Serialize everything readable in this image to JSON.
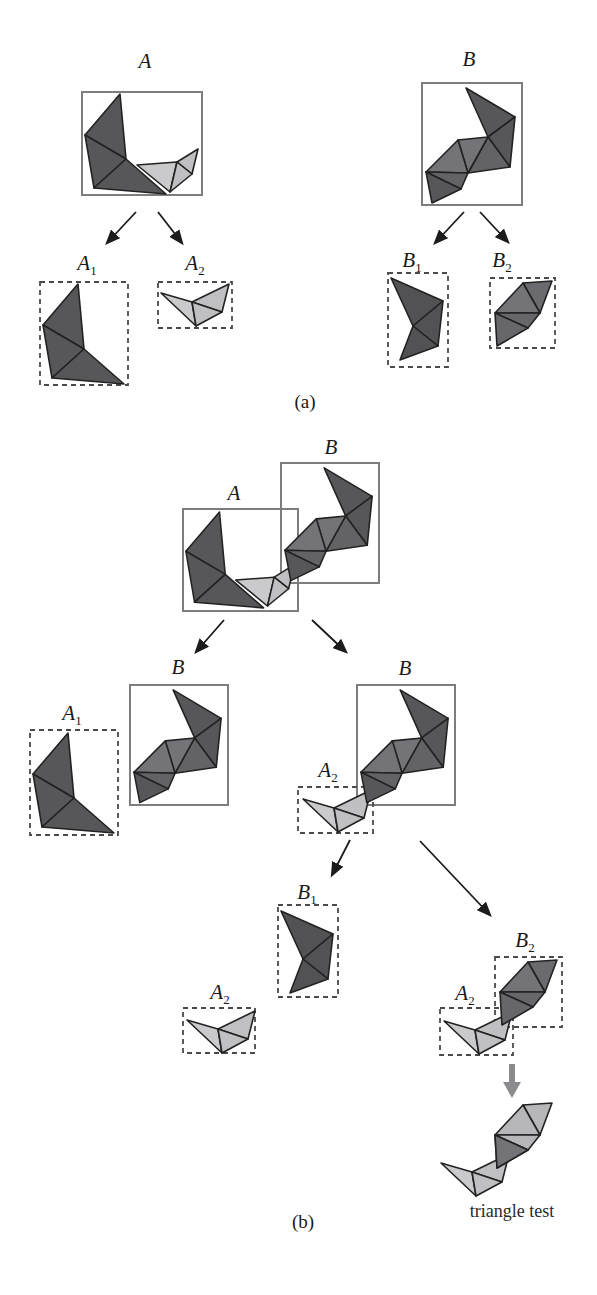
{
  "labels": {
    "A": "A",
    "B": "B",
    "sub1": "1",
    "sub2": "2",
    "panel_a": "(a)",
    "panel_b": "(b)",
    "triangle_test": "triangle test"
  },
  "colors": {
    "dark": "#57575a",
    "dark_alt": "#525255",
    "mid_dark": "#636366",
    "mid": "#747478",
    "mid_alt": "#6b6b6f",
    "mid_low": "#67676b",
    "light": "#c0c0c2",
    "light_alt": "#cacacc",
    "outline": "#222222",
    "box_border": "#7d7d7d",
    "dashed_border": "#4a4a4a",
    "arrow": "#1c1c1c",
    "thick_arrow": "#8b8b8d",
    "test_dark": "#737377",
    "test_light": "#b7b7b9",
    "background": "#ffffff"
  }
}
